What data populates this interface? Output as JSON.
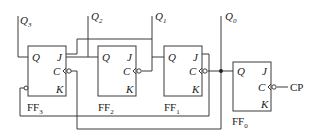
{
  "diagram": {
    "type": "sequential-logic-circuit",
    "outputs": [
      "Q3",
      "Q2",
      "Q1",
      "Q0"
    ],
    "output_labels": {
      "q3": {
        "main": "Q",
        "sub": "3"
      },
      "q2": {
        "main": "Q",
        "sub": "2"
      },
      "q1": {
        "main": "Q",
        "sub": "1"
      },
      "q0": {
        "main": "Q",
        "sub": "0"
      }
    },
    "flipflops": [
      {
        "id": "FF3",
        "name": "FF",
        "sub": "3",
        "pins": {
          "q": "Q",
          "j": "J",
          "c": "C",
          "k": "K"
        }
      },
      {
        "id": "FF2",
        "name": "FF",
        "sub": "2",
        "pins": {
          "q": "Q",
          "j": "J",
          "c": "C",
          "k": "K"
        }
      },
      {
        "id": "FF1",
        "name": "FF",
        "sub": "1",
        "pins": {
          "q": "Q",
          "j": "J",
          "c": "C",
          "k": "K"
        }
      },
      {
        "id": "FF0",
        "name": "FF",
        "sub": "0",
        "pins": {
          "q": "Q",
          "j": "J",
          "c": "C",
          "k": "K"
        }
      }
    ],
    "clock_input": "CP"
  }
}
